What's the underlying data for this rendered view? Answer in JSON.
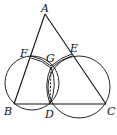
{
  "figure": {
    "type": "geometry",
    "points": {
      "A": "A",
      "B": "B",
      "C": "C",
      "D": "D",
      "E": "E",
      "F": "F",
      "G": "G"
    },
    "segments": [
      "AB",
      "AC",
      "BC",
      "FG",
      "GE",
      "GD"
    ],
    "dashed_segments": [
      "GD"
    ],
    "circles": [
      "circle through B, F, G, D",
      "circle through D, G, E, C"
    ]
  }
}
